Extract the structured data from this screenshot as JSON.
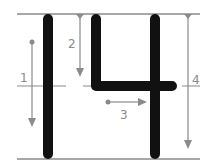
{
  "diagram": {
    "subject": "14",
    "colors": {
      "stroke": "#111111",
      "guide": "#8a8a8a",
      "background": "#ffffff"
    },
    "strokes": [
      {
        "number": "1",
        "label": "1",
        "direction": "down"
      },
      {
        "number": "2",
        "label": "2",
        "direction": "down"
      },
      {
        "number": "3",
        "label": "3",
        "direction": "right"
      },
      {
        "number": "4",
        "label": "4",
        "direction": "down"
      }
    ]
  }
}
